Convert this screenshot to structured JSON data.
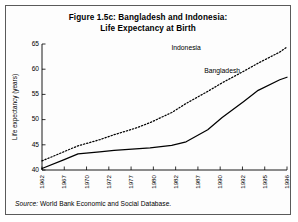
{
  "figure": {
    "title_line1": "Figure 1.5c: Bangladesh and Indonesia:",
    "title_line2": "Life Expectancy at Birth",
    "source_label": "Source:",
    "source_text": "World Bank Economic and Social Database."
  },
  "chart_data": {
    "type": "line",
    "title": "Figure 1.5c: Bangladesh and Indonesia: Life Expectancy at Birth",
    "xlabel": "",
    "ylabel": "Life expectancy (years)",
    "ylim": [
      40,
      65
    ],
    "yticks": [
      40,
      45,
      50,
      55,
      60,
      65
    ],
    "xtick_labels": [
      "1962",
      "1967",
      "1970",
      "1972",
      "1977",
      "1980",
      "1982",
      "1987",
      "1990",
      "1992",
      "1995",
      "1996"
    ],
    "grid": false,
    "legend": "inline-labels",
    "x": [
      1962,
      1965,
      1967,
      1970,
      1972,
      1975,
      1977,
      1980,
      1982,
      1985,
      1987,
      1990,
      1992,
      1995,
      1996
    ],
    "series": [
      {
        "name": "Bangladesh",
        "style": "solid",
        "label_x": 1987,
        "label_y": 59.2,
        "values": [
          40.3,
          42.0,
          43.2,
          43.6,
          43.9,
          44.2,
          44.4,
          44.9,
          45.6,
          48.0,
          50.4,
          53.6,
          55.8,
          57.9,
          58.4
        ]
      },
      {
        "name": "Indonesia",
        "style": "dotted",
        "label_x": 1982,
        "label_y": 63.8,
        "values": [
          41.8,
          43.6,
          44.8,
          46.0,
          47.0,
          48.3,
          49.4,
          51.4,
          53.2,
          55.6,
          57.3,
          59.6,
          61.2,
          63.4,
          64.4
        ]
      }
    ]
  }
}
